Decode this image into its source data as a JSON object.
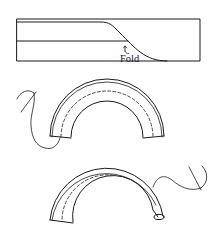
{
  "figure": {
    "panels": [
      {
        "id": "fold-strip",
        "description": "Flat strip with diagonal fold line",
        "label": "Fold"
      },
      {
        "id": "curved-binding-step1",
        "description": "Curved strip basted along dashed line with needle and thread at left end"
      },
      {
        "id": "curved-binding-step2",
        "description": "Curved strip rolled over at right end with needle and thread"
      }
    ],
    "fold_label": "Fold",
    "stroke_color": "#1a1a1a",
    "background_color": "#ffffff"
  }
}
